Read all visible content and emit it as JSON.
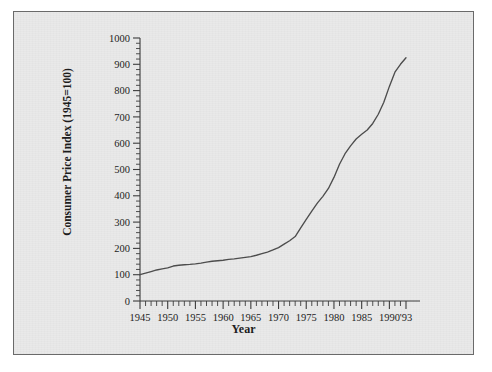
{
  "chart_data": {
    "type": "line",
    "title": "",
    "xlabel": "Year",
    "ylabel": "Consumer Price Index (1945=100)",
    "xlim": [
      1945,
      1993
    ],
    "ylim": [
      0,
      1000
    ],
    "ytick_labels": [
      "0",
      "100",
      "200",
      "300",
      "400",
      "500",
      "600",
      "700",
      "800",
      "900",
      "1000"
    ],
    "ytick_values": [
      0,
      100,
      200,
      300,
      400,
      500,
      600,
      700,
      800,
      900,
      1000
    ],
    "ytick_minor_step": 20,
    "xtick_labels": [
      "1945",
      "1950",
      "1955",
      "1960",
      "1965",
      "1970",
      "1975",
      "1980",
      "1985",
      "1990",
      "'93"
    ],
    "xtick_values": [
      1945,
      1950,
      1955,
      1960,
      1965,
      1970,
      1975,
      1980,
      1985,
      1990,
      1993
    ],
    "xtick_minor_step": 1,
    "grid": false,
    "legend": "none",
    "line_color": "#4b4b4b",
    "background_color": "#e9e9e9",
    "border_color": "#6a6a6a",
    "series": [
      {
        "name": "Consumer Price Index",
        "x": [
          1945,
          1946,
          1947,
          1948,
          1949,
          1950,
          1951,
          1952,
          1953,
          1954,
          1955,
          1956,
          1957,
          1958,
          1959,
          1960,
          1961,
          1962,
          1963,
          1964,
          1965,
          1966,
          1967,
          1968,
          1969,
          1970,
          1971,
          1972,
          1973,
          1974,
          1975,
          1976,
          1977,
          1978,
          1979,
          1980,
          1981,
          1982,
          1983,
          1984,
          1985,
          1986,
          1987,
          1988,
          1989,
          1990,
          1991,
          1992,
          1993
        ],
        "values": [
          100,
          106,
          112,
          118,
          122,
          126,
          133,
          136,
          138,
          139,
          141,
          144,
          148,
          151,
          153,
          155,
          158,
          160,
          163,
          166,
          169,
          174,
          180,
          186,
          194,
          203,
          216,
          229,
          245,
          278,
          310,
          342,
          372,
          398,
          428,
          470,
          520,
          560,
          590,
          616,
          634,
          650,
          675,
          710,
          756,
          816,
          870,
          900,
          925
        ]
      }
    ]
  },
  "axes": {
    "y_axis_title": "Consumer Price Index (1945=100)",
    "x_axis_title": "Year"
  }
}
